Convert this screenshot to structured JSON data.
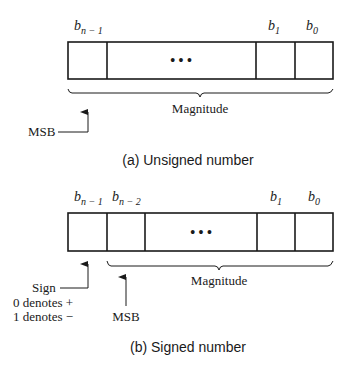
{
  "figure_a": {
    "bit_labels": {
      "msb": {
        "base": "b",
        "sub": "n − 1"
      },
      "b1": {
        "base": "b",
        "sub": "1"
      },
      "b0": {
        "base": "b",
        "sub": "0"
      }
    },
    "ellipsis": "• • •",
    "brace_label": "Magnitude",
    "arrow_label": "MSB",
    "caption": "(a) Unsigned number"
  },
  "figure_b": {
    "bit_labels": {
      "sign": {
        "base": "b",
        "sub": "n − 1"
      },
      "msb": {
        "base": "b",
        "sub": "n − 2"
      },
      "b1": {
        "base": "b",
        "sub": "1"
      },
      "b0": {
        "base": "b",
        "sub": "0"
      }
    },
    "ellipsis": "• • •",
    "brace_label": "Magnitude",
    "sign_label": "Sign",
    "sign_note_1": "0 denotes +",
    "sign_note_2": "1 denotes −",
    "msb_label": "MSB",
    "caption": "(b) Signed number"
  }
}
